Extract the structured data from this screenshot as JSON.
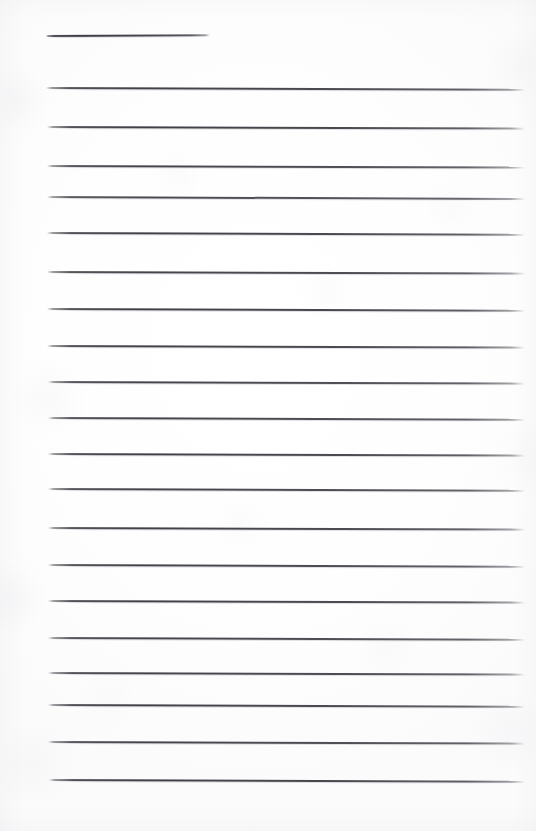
{
  "document": {
    "type": "scanned-lined-notepad-page",
    "title": "Blank ruled notepad page",
    "page_width": 536,
    "page_height": 831,
    "paper_color": "#fdfdfe",
    "rule_color": "#34363c",
    "rule_thickness": 2,
    "text_content": "",
    "is_blank": true,
    "rule_count": 20,
    "left_margin": 46,
    "right_margin": 525
  },
  "rules": [
    {
      "index": 1,
      "x": 46,
      "y": 35,
      "width": 164,
      "tilt": -0.3,
      "opacity": 0.95,
      "kind": "short"
    },
    {
      "index": 2,
      "x": 46,
      "y": 87,
      "width": 479,
      "tilt": 0.22,
      "opacity": 0.92,
      "kind": "full"
    },
    {
      "index": 3,
      "x": 47,
      "y": 126,
      "width": 478,
      "tilt": 0.2,
      "opacity": 0.93,
      "kind": "full"
    },
    {
      "index": 4,
      "x": 47,
      "y": 165,
      "width": 478,
      "tilt": 0.18,
      "opacity": 0.9,
      "kind": "full"
    },
    {
      "index": 5,
      "x": 47,
      "y": 196,
      "width": 478,
      "tilt": 0.24,
      "opacity": 0.88,
      "kind": "full"
    },
    {
      "index": 6,
      "x": 47,
      "y": 232,
      "width": 478,
      "tilt": 0.22,
      "opacity": 0.92,
      "kind": "full"
    },
    {
      "index": 7,
      "x": 47,
      "y": 271,
      "width": 478,
      "tilt": 0.2,
      "opacity": 0.91,
      "kind": "full"
    },
    {
      "index": 8,
      "x": 47,
      "y": 308,
      "width": 478,
      "tilt": 0.22,
      "opacity": 0.93,
      "kind": "full"
    },
    {
      "index": 9,
      "x": 47,
      "y": 345,
      "width": 478,
      "tilt": 0.2,
      "opacity": 0.92,
      "kind": "full"
    },
    {
      "index": 10,
      "x": 48,
      "y": 381,
      "width": 477,
      "tilt": 0.2,
      "opacity": 0.9,
      "kind": "full"
    },
    {
      "index": 11,
      "x": 48,
      "y": 417,
      "width": 477,
      "tilt": 0.22,
      "opacity": 0.91,
      "kind": "full"
    },
    {
      "index": 12,
      "x": 48,
      "y": 453,
      "width": 477,
      "tilt": 0.2,
      "opacity": 0.92,
      "kind": "full"
    },
    {
      "index": 13,
      "x": 48,
      "y": 488,
      "width": 477,
      "tilt": 0.22,
      "opacity": 0.9,
      "kind": "full"
    },
    {
      "index": 14,
      "x": 48,
      "y": 527,
      "width": 477,
      "tilt": 0.2,
      "opacity": 0.92,
      "kind": "full"
    },
    {
      "index": 15,
      "x": 48,
      "y": 564,
      "width": 477,
      "tilt": 0.22,
      "opacity": 0.91,
      "kind": "full"
    },
    {
      "index": 16,
      "x": 48,
      "y": 600,
      "width": 477,
      "tilt": 0.2,
      "opacity": 0.92,
      "kind": "full"
    },
    {
      "index": 17,
      "x": 48,
      "y": 637,
      "width": 477,
      "tilt": 0.22,
      "opacity": 0.9,
      "kind": "full"
    },
    {
      "index": 18,
      "x": 48,
      "y": 672,
      "width": 477,
      "tilt": 0.2,
      "opacity": 0.91,
      "kind": "full"
    },
    {
      "index": 19,
      "x": 48,
      "y": 704,
      "width": 477,
      "tilt": 0.22,
      "opacity": 0.92,
      "kind": "full"
    },
    {
      "index": 20,
      "x": 48,
      "y": 741,
      "width": 477,
      "tilt": 0.2,
      "opacity": 0.9,
      "kind": "full"
    },
    {
      "index": 21,
      "x": 49,
      "y": 779,
      "width": 476,
      "tilt": 0.22,
      "opacity": 0.93,
      "kind": "full"
    }
  ]
}
